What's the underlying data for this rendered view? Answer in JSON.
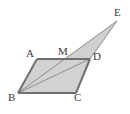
{
  "figure": {
    "kind": "geometry-diagram",
    "canvas": {
      "width": 130,
      "height": 114
    },
    "colors": {
      "fill": "#d2d2d2",
      "fill_triangle": "#d0d0d0",
      "stroke": "#6e6e6e",
      "stroke_thin": "#8a8a8a",
      "label": "#3a3a3a",
      "background": "#ffffff"
    },
    "points": [
      {
        "id": "A",
        "label": "A",
        "x": 37,
        "y": 59,
        "label_x": 26,
        "label_y": 48
      },
      {
        "id": "B",
        "label": "B",
        "x": 18,
        "y": 93,
        "label_x": 8,
        "label_y": 92
      },
      {
        "id": "C",
        "label": "C",
        "x": 76,
        "y": 93,
        "label_x": 74,
        "label_y": 92
      },
      {
        "id": "D",
        "label": "D",
        "x": 90,
        "y": 59,
        "label_x": 93,
        "label_y": 51
      },
      {
        "id": "M",
        "label": "M",
        "x": 64,
        "y": 59,
        "label_x": 58,
        "label_y": 46
      },
      {
        "id": "E",
        "label": "E",
        "x": 117,
        "y": 21,
        "label_x": 114,
        "label_y": 7
      }
    ],
    "polygons": [
      {
        "name": "parallelogram-ABCD",
        "points": "37,59 90,59 76,93 18,93"
      },
      {
        "name": "triangle-MDE",
        "points": "64,59 90,59 117,21"
      }
    ],
    "segments": [
      {
        "name": "segment-AD",
        "from": "A",
        "to": "D",
        "weight": "thick"
      },
      {
        "name": "segment-AB",
        "from": "A",
        "to": "B",
        "weight": "thick"
      },
      {
        "name": "segment-BC",
        "from": "B",
        "to": "C",
        "weight": "thick"
      },
      {
        "name": "segment-CD",
        "from": "C",
        "to": "D",
        "weight": "thick"
      },
      {
        "name": "segment-BD",
        "from": "B",
        "to": "D",
        "weight": "thin"
      },
      {
        "name": "segment-BE",
        "from": "B",
        "to": "E",
        "weight": "thin"
      },
      {
        "name": "segment-DE",
        "from": "D",
        "to": "E",
        "weight": "thin"
      }
    ]
  }
}
